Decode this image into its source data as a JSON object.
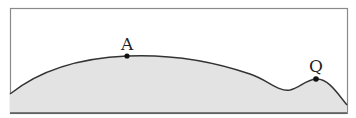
{
  "diagram": {
    "type": "terrain-profile",
    "labels": {
      "point_a": "A",
      "point_q": "Q"
    },
    "colors": {
      "frame": "#8a8a8a",
      "ground_fill": "#e3e3e3",
      "outline": "#333333",
      "point": "#111111"
    }
  }
}
